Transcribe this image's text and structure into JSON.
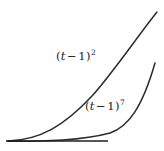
{
  "figure": {
    "type": "math-plot",
    "background_color": "#ffffff",
    "curve_color": "#2b2b2b",
    "axis_color": "#1f1f1f",
    "label_color": "#222222"
  },
  "labels": {
    "quadratic": {
      "name": "(t-1)^2",
      "open_paren": "(",
      "variable": "t",
      "operator": "−",
      "constant": "1",
      "close_paren": ")",
      "exponent": "2"
    },
    "septic": {
      "name": "(t-1)^7",
      "open_paren": "(",
      "variable": "t",
      "operator": "−",
      "constant": "1",
      "close_paren": ")",
      "exponent": "7"
    }
  },
  "chart_data": {
    "type": "line",
    "title": "",
    "xlabel": "",
    "ylabel": "",
    "grid": false,
    "legend": "inline-annotations",
    "xlim": [
      1.0,
      2.6
    ],
    "ylim": [
      0.0,
      2.8
    ],
    "axis": {
      "baseline_drawn": true,
      "baseline_y_value": 0.0,
      "x_axis_only": true
    },
    "series": [
      {
        "name": "(t-1)^2",
        "expression": "(t - 1)^2",
        "exponent": 2,
        "x": [
          1.0,
          1.1,
          1.2,
          1.3,
          1.4,
          1.5,
          1.6,
          1.7,
          1.8,
          1.9,
          2.0,
          2.1,
          2.2,
          2.3,
          2.4,
          2.5,
          2.6
        ],
        "y": [
          0.0,
          0.01,
          0.04,
          0.09,
          0.16,
          0.25,
          0.36,
          0.49,
          0.64,
          0.81,
          1.0,
          1.21,
          1.44,
          1.69,
          1.96,
          2.25,
          2.56
        ],
        "annotation": "(t-1)^2",
        "annotation_position": "upper-left-of-curve"
      },
      {
        "name": "(t-1)^7",
        "expression": "(t - 1)^7",
        "exponent": 7,
        "x": [
          1.0,
          1.1,
          1.2,
          1.3,
          1.4,
          1.5,
          1.6,
          1.7,
          1.8,
          1.9,
          2.0,
          2.1,
          2.2,
          2.3,
          2.4,
          2.5,
          2.6
        ],
        "y": [
          0.0,
          0.0,
          0.0,
          0.0,
          0.002,
          0.008,
          0.028,
          0.082,
          0.21,
          0.478,
          1.0,
          1.949,
          3.583,
          6.275,
          10.54,
          17.09,
          26.84
        ],
        "annotation": "(t-1)^7",
        "annotation_position": "left-of-curve"
      }
    ],
    "paths": {
      "baseline": "M 6,141 L 108,141",
      "quadratic_curve": "M 8,141 C 40,140 64,126 92,96 C 112,74 140,33 157,12",
      "septic_curve": "M 8,141.3 C 46,141.3 82,140.6 110,133 C 128,127 142,108 155,63"
    }
  }
}
